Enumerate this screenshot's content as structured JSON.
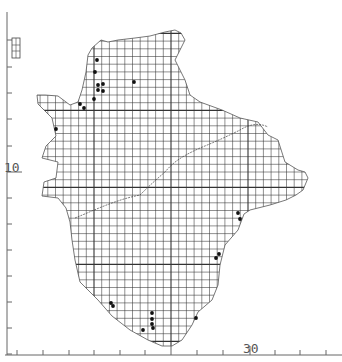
{
  "map": {
    "title": "",
    "grid": {
      "cell_size_px": 7.7,
      "major_every": 10,
      "line_color": "#333333"
    },
    "axes": {
      "x": {
        "labels": [
          {
            "text": "30",
            "x": 250,
            "y": 355
          }
        ],
        "ticks_px": [
          17,
          94,
          171,
          250,
          326
        ]
      },
      "y": {
        "labels": [
          {
            "text": "10",
            "x": 4,
            "y": 172
          }
        ],
        "ticks_px": [
          40,
          67,
          93,
          119,
          146,
          172,
          198,
          224,
          250,
          276,
          302,
          328,
          354
        ]
      }
    },
    "outline_color": "#555555",
    "record_marker_color": "#111111",
    "records_count": 26
  }
}
